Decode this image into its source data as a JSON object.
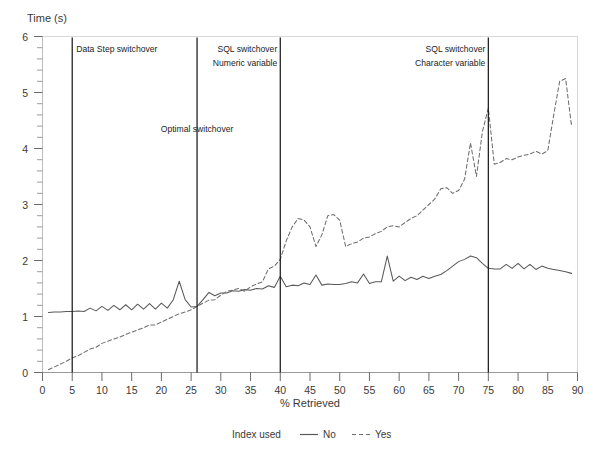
{
  "chart_data": {
    "type": "line",
    "title": "",
    "ylabel": "Time (s)",
    "xlabel": "% Retrieved",
    "xlim": [
      0,
      90
    ],
    "ylim": [
      0,
      6
    ],
    "xticks": [
      0,
      5,
      10,
      15,
      20,
      25,
      30,
      35,
      40,
      45,
      50,
      55,
      60,
      65,
      70,
      75,
      80,
      85,
      90
    ],
    "xtick_labels": [
      "0",
      "5",
      "10",
      "15",
      "20",
      "25",
      "30",
      "35",
      "40",
      "45",
      "50",
      "55",
      "60",
      "65",
      "70",
      "75",
      "80",
      "85",
      "90"
    ],
    "yticks": [
      0,
      1,
      2,
      3,
      4,
      5,
      6
    ],
    "ytick_labels": [
      "0",
      "1",
      "2",
      "3",
      "4",
      "5",
      "6"
    ],
    "y_minor_ticks": [
      0.2,
      0.4,
      0.6,
      0.8,
      1.2,
      1.4,
      1.6,
      1.8,
      2.2,
      2.4,
      2.6,
      2.8,
      3.2,
      3.4,
      3.6,
      3.8,
      4.2,
      4.4,
      4.6,
      4.8,
      5.2,
      5.4,
      5.6,
      5.8
    ],
    "grid": false,
    "legend": {
      "position": "bottom",
      "title": "Index used",
      "entries": [
        {
          "label": "No",
          "style": "solid",
          "color": "#595959"
        },
        {
          "label": "Yes",
          "style": "dashed",
          "color": "#6e6e6e"
        }
      ]
    },
    "series": [
      {
        "name": "No",
        "legend_label": "No",
        "style": "solid",
        "color": "#595959",
        "x": [
          1,
          2,
          3,
          4,
          5,
          6,
          7,
          8,
          9,
          10,
          11,
          12,
          13,
          14,
          15,
          16,
          17,
          18,
          19,
          20,
          21,
          22,
          23,
          24,
          25,
          26,
          27,
          28,
          29,
          30,
          31,
          32,
          33,
          34,
          35,
          36,
          37,
          38,
          39,
          40,
          41,
          42,
          43,
          44,
          45,
          46,
          47,
          48,
          49,
          50,
          51,
          52,
          53,
          54,
          55,
          56,
          57,
          58,
          59,
          60,
          61,
          62,
          63,
          64,
          65,
          66,
          67,
          68,
          69,
          70,
          71,
          72,
          73,
          74,
          75,
          76,
          77,
          78,
          79,
          80,
          81,
          82,
          83,
          84,
          85,
          86,
          87,
          88,
          89
        ],
        "y": [
          1.07,
          1.08,
          1.08,
          1.09,
          1.09,
          1.1,
          1.09,
          1.15,
          1.1,
          1.18,
          1.11,
          1.2,
          1.12,
          1.21,
          1.12,
          1.22,
          1.13,
          1.23,
          1.13,
          1.24,
          1.15,
          1.3,
          1.63,
          1.3,
          1.17,
          1.18,
          1.3,
          1.43,
          1.37,
          1.42,
          1.42,
          1.46,
          1.45,
          1.48,
          1.47,
          1.5,
          1.49,
          1.55,
          1.52,
          1.72,
          1.53,
          1.56,
          1.55,
          1.6,
          1.57,
          1.74,
          1.56,
          1.58,
          1.57,
          1.57,
          1.59,
          1.62,
          1.6,
          1.76,
          1.59,
          1.62,
          1.62,
          2.08,
          1.63,
          1.72,
          1.64,
          1.7,
          1.66,
          1.72,
          1.68,
          1.72,
          1.75,
          1.82,
          1.9,
          1.98,
          2.02,
          2.08,
          2.05,
          1.95,
          1.86,
          1.85,
          1.85,
          1.93,
          1.86,
          1.95,
          1.85,
          1.93,
          1.84,
          1.9,
          1.86,
          1.84,
          1.82,
          1.8,
          1.77
        ]
      },
      {
        "name": "Yes",
        "legend_label": "Yes",
        "style": "dashed",
        "color": "#6e6e6e",
        "x": [
          1,
          2,
          3,
          4,
          5,
          6,
          7,
          8,
          9,
          10,
          11,
          12,
          13,
          14,
          15,
          16,
          17,
          18,
          19,
          20,
          21,
          22,
          23,
          24,
          25,
          26,
          27,
          28,
          29,
          30,
          31,
          32,
          33,
          34,
          35,
          36,
          37,
          38,
          39,
          40,
          41,
          42,
          43,
          44,
          45,
          46,
          47,
          48,
          49,
          50,
          51,
          52,
          53,
          54,
          55,
          56,
          57,
          58,
          59,
          60,
          61,
          62,
          63,
          64,
          65,
          66,
          67,
          68,
          69,
          70,
          71,
          72,
          73,
          74,
          75,
          76,
          77,
          78,
          79,
          80,
          81,
          82,
          83,
          84,
          85,
          86,
          87,
          88,
          89
        ],
        "y": [
          0.05,
          0.1,
          0.15,
          0.2,
          0.26,
          0.3,
          0.36,
          0.42,
          0.45,
          0.52,
          0.56,
          0.6,
          0.63,
          0.68,
          0.72,
          0.76,
          0.8,
          0.85,
          0.85,
          0.9,
          0.95,
          1.0,
          1.05,
          1.08,
          1.12,
          1.18,
          1.24,
          1.29,
          1.3,
          1.38,
          1.45,
          1.47,
          1.5,
          1.45,
          1.53,
          1.58,
          1.62,
          1.85,
          1.9,
          2.02,
          2.35,
          2.6,
          2.75,
          2.72,
          2.6,
          2.25,
          2.46,
          2.8,
          2.82,
          2.72,
          2.25,
          2.3,
          2.33,
          2.4,
          2.42,
          2.48,
          2.52,
          2.6,
          2.62,
          2.6,
          2.68,
          2.75,
          2.8,
          2.9,
          3.0,
          3.1,
          3.28,
          3.3,
          3.2,
          3.25,
          3.45,
          4.1,
          3.5,
          4.3,
          4.72,
          3.72,
          3.75,
          3.82,
          3.8,
          3.85,
          3.88,
          3.9,
          3.95,
          3.9,
          3.96,
          4.6,
          5.2,
          5.25,
          4.4
        ]
      }
    ],
    "reference_lines": [
      {
        "x": 5,
        "label_lines": [
          "Data Step switchover"
        ],
        "align": "left",
        "label_y": 5.72
      },
      {
        "x": 26,
        "label_lines": [
          "Optimal switchover"
        ],
        "align": "center",
        "label_y": 4.3
      },
      {
        "x": 40,
        "label_lines": [
          "SQL switchover",
          "Numeric variable"
        ],
        "align": "right",
        "label_y": 5.72
      },
      {
        "x": 75,
        "label_lines": [
          "SQL switchover",
          "Character variable"
        ],
        "align": "right",
        "label_y": 5.72
      }
    ]
  },
  "colors": {
    "axis": "#3a3a3a",
    "frame": "#d8d8d8",
    "reference_line": "#1b1b1b",
    "series_no": "#595959",
    "series_yes": "#6e6e6e",
    "text": "#2b2b2b",
    "background": "#ffffff"
  },
  "axes": {
    "y_title": "Time (s)",
    "x_title": "% Retrieved"
  },
  "legend": {
    "title": "Index used",
    "entry_no": "No",
    "entry_yes": "Yes"
  }
}
